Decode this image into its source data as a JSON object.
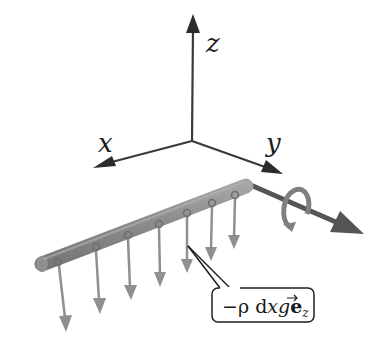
{
  "diagram": {
    "axes": {
      "origin": [
        192,
        141
      ],
      "x": {
        "label": "x",
        "tip": [
          94,
          167
        ]
      },
      "y": {
        "label": "y",
        "tip": [
          283,
          174
        ]
      },
      "z": {
        "label": "z",
        "tip": [
          193,
          17
        ]
      },
      "color": "#3a3a3a"
    },
    "rod": {
      "start": [
        40,
        265
      ],
      "end": [
        246,
        185
      ],
      "color": "#8a8a8a",
      "point_count": 8
    },
    "load_arrows": {
      "color": "#8f8f8f",
      "items": [
        {
          "from": [
            58,
            262
          ],
          "to": [
            66,
            330
          ]
        },
        {
          "from": [
            96,
            247
          ],
          "to": [
            100,
            312
          ]
        },
        {
          "from": [
            128,
            235
          ],
          "to": [
            131,
            299
          ]
        },
        {
          "from": [
            159,
            224
          ],
          "to": [
            160,
            286
          ]
        },
        {
          "from": [
            187,
            213
          ],
          "to": [
            187,
            272
          ]
        },
        {
          "from": [
            212,
            203
          ],
          "to": [
            211,
            260
          ]
        },
        {
          "from": [
            235,
            195
          ],
          "to": [
            234,
            248
          ]
        }
      ]
    },
    "moment_axis": {
      "from": [
        246,
        183
      ],
      "to": [
        362,
        233
      ],
      "color": "#555555",
      "rotation_color": "#7a7a7a"
    },
    "callout": {
      "text": "−ρ dx g e⃗z",
      "parts": {
        "prefix": "−ρ d",
        "x": "x",
        "g": "g",
        "vec": "e",
        "sub": "z"
      },
      "box": {
        "x": 212,
        "y": 288,
        "w": 102,
        "h": 34
      }
    }
  }
}
